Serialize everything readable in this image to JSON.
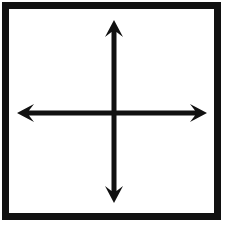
{
  "document": {
    "title": "Coordinate axes cross diagram",
    "medium": "scanned black ink line drawing on white paper",
    "width": 227,
    "height": 227
  },
  "colors": {
    "background": "#ffffff",
    "ink": "#111111",
    "ink_soft": "#1a1a1a",
    "paper_tint": "#fdfdfd"
  },
  "frame": {
    "name": "outer border rectangle",
    "shape": "rectangle",
    "stroke_color": "#111111",
    "stroke_width": 7,
    "left": 5.5,
    "top": 5.5,
    "right": 217.5,
    "bottom": 216.5
  },
  "cross": {
    "name": "four-headed cross of arrows",
    "center_x": 114,
    "center_y": 113,
    "shaft_width": 5,
    "stroke_color": "#111111",
    "arrowhead": {
      "style": "concave barbed triangle",
      "length": 17,
      "half_width": 9,
      "notch_depth": 5
    },
    "arrows": [
      {
        "name": "up-arrow",
        "direction": "up",
        "tip_x": 114,
        "tip_y": 20,
        "tail_x": 114,
        "tail_y": 113,
        "label": "Up arrow"
      },
      {
        "name": "down-arrow",
        "direction": "down",
        "tip_x": 114,
        "tip_y": 203,
        "tail_x": 114,
        "tail_y": 113,
        "label": "Down arrow"
      },
      {
        "name": "left-arrow",
        "direction": "left",
        "tip_x": 17,
        "tip_y": 113,
        "tail_x": 114,
        "tail_y": 113,
        "label": "Left arrow"
      },
      {
        "name": "right-arrow",
        "direction": "right",
        "tip_x": 207,
        "tip_y": 113,
        "tail_x": 114,
        "tail_y": 113,
        "label": "Right arrow"
      }
    ]
  },
  "annotations": {
    "visible_text": [],
    "note": "No text labels are present anywhere in the image."
  }
}
